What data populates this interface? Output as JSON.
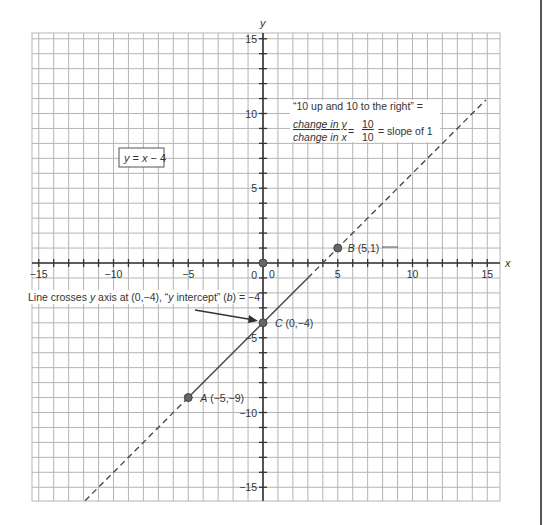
{
  "figure": {
    "equation_label": "y = x − 4",
    "equation_parts": {
      "y": "y",
      "eq": " = ",
      "x": "x",
      "rest": " − 4"
    },
    "axis_labels": {
      "x": "x",
      "y": "y"
    },
    "x_ticks": [
      {
        "value": -15,
        "label": "−15"
      },
      {
        "value": -10,
        "label": "−10"
      },
      {
        "value": -5,
        "label": "−5"
      },
      {
        "value": 0,
        "label": "0"
      },
      {
        "value": 5,
        "label": "5"
      },
      {
        "value": 10,
        "label": "10"
      },
      {
        "value": 15,
        "label": "15"
      }
    ],
    "y_ticks": [
      {
        "value": 15,
        "label": "15"
      },
      {
        "value": 10,
        "label": "10"
      },
      {
        "value": 5,
        "label": "5"
      },
      {
        "value": 0,
        "label": "0"
      },
      {
        "value": -5,
        "label": "−5"
      },
      {
        "value": -10,
        "label": "−10"
      },
      {
        "value": -15,
        "label": "−15"
      }
    ],
    "points": [
      {
        "name": "A",
        "coords": "(−5,−9)",
        "x": -5,
        "y": -9
      },
      {
        "name": "B",
        "coords": "(5,1)",
        "x": 5,
        "y": 1
      },
      {
        "name": "C",
        "coords": "(0,−4)",
        "x": 0,
        "y": -4
      },
      {
        "name": "origin",
        "coords": "",
        "x": 0,
        "y": 0
      }
    ],
    "slope_note": {
      "line1": "“10 up and 10 to the right” =",
      "numerator": "change in y",
      "denominator": "change in x",
      "equals": "=",
      "frac_num": "10",
      "frac_den": "10",
      "result": "= slope of 1"
    },
    "intercept_note": {
      "prefix": "Line crosses ",
      "y_italic": "y",
      "middle": " axis at (0,−4), “",
      "y_italic2": "y",
      "middle2": " intercept” (",
      "b_italic": "b",
      "suffix": ") = −4"
    }
  },
  "colors": {
    "grid": "#b5b5b5",
    "axis": "#333333",
    "line": "#444444",
    "point": "#666666",
    "text": "#333333"
  }
}
